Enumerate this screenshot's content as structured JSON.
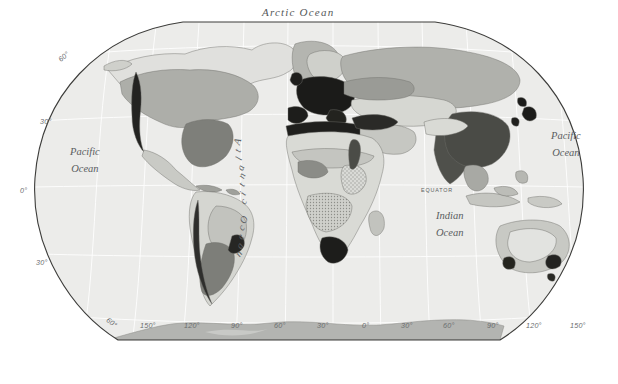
{
  "map": {
    "title_visible": false,
    "projection": "winkel-tripel",
    "background_color": "#ffffff",
    "ocean_color": "#ececeb",
    "graticule_color": "#ffffff",
    "outline_color": "#3a3a3a",
    "antarctica_color": "#b4b4b2",
    "density_palette": {
      "class_1_lightest": "#e4e4e1",
      "class_2_light": "#d2d3cf",
      "class_3_medium": "#b9bab5",
      "class_4_dark": "#9a9b96",
      "class_5_darker": "#7d7e79",
      "class_6_darkest": "#1c1c1a"
    },
    "ocean_labels": [
      {
        "name": "arctic-ocean",
        "text": "Arctic   Ocean",
        "x": 262,
        "y": 6
      },
      {
        "name": "pacific-ocean-left",
        "text_line1": "Pacific",
        "text_line2": "Ocean",
        "x": 70,
        "y": 148
      },
      {
        "name": "pacific-ocean-right",
        "text_line1": "Pacific",
        "text_line2": "Ocean",
        "x": 551,
        "y": 132
      },
      {
        "name": "indian-ocean",
        "text_line1": "Indian",
        "text_line2": "Ocean",
        "x": 436,
        "y": 212
      },
      {
        "name": "atlantic-ocean",
        "text": "Atlantic Ocean",
        "x": 236,
        "y": 136
      }
    ],
    "equator_label": {
      "text": "EQUATOR",
      "x": 421,
      "y": 187
    },
    "latitude_labels": [
      {
        "text": "60°",
        "x": 58,
        "y": 52
      },
      {
        "text": "30°",
        "x": 40,
        "y": 117
      },
      {
        "text": "0°",
        "x": 20,
        "y": 186
      },
      {
        "text": "30°",
        "x": 36,
        "y": 258
      },
      {
        "text": "60°",
        "x": 106,
        "y": 318
      }
    ],
    "longitude_labels_bottom": [
      {
        "text": "150°",
        "x": 140,
        "y": 321
      },
      {
        "text": "120°",
        "x": 184,
        "y": 321
      },
      {
        "text": "90°",
        "x": 231,
        "y": 321
      },
      {
        "text": "60°",
        "x": 274,
        "y": 321
      },
      {
        "text": "30°",
        "x": 317,
        "y": 321
      },
      {
        "text": "0°",
        "x": 362,
        "y": 321
      },
      {
        "text": "30°",
        "x": 401,
        "y": 321
      },
      {
        "text": "60°",
        "x": 443,
        "y": 321
      },
      {
        "text": "90°",
        "x": 487,
        "y": 321
      },
      {
        "text": "120°",
        "x": 526,
        "y": 321
      },
      {
        "text": "150°",
        "x": 570,
        "y": 321
      }
    ]
  }
}
